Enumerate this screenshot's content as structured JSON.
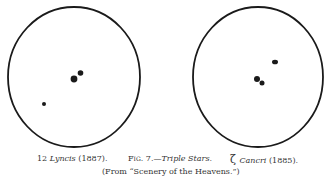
{
  "figure": {
    "left_label": {
      "name": "12 ",
      "italic": "Lyncis",
      "year": " (1887)."
    },
    "center_label": {
      "fig": "Fig. 7.",
      "dash": "—",
      "title": "Triple Stars."
    },
    "right_label": {
      "symbol": "ζ ",
      "italic": "Cancri",
      "year": " (1885)."
    },
    "source": "(From “Scenery of the Heavens.”)"
  },
  "colors": {
    "ink": "#1a1a1a",
    "paper": "#ffffff"
  }
}
